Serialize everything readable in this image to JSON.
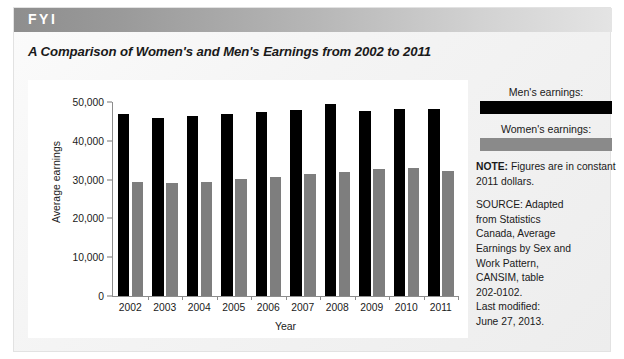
{
  "banner": {
    "label": "FYI"
  },
  "figure": {
    "title": "A Comparison of Women's and Men's Earnings from 2002 to 2011"
  },
  "legend": {
    "men_label": "Men's earnings:",
    "women_label": "Women's earnings:",
    "men_color": "#000000",
    "women_color": "#8a8a8a"
  },
  "note": {
    "label": "NOTE:",
    "text": "Figures are in constant 2011 dollars."
  },
  "source": {
    "lines": [
      "SOURCE: Adapted",
      "from Statistics",
      "Canada, Average",
      "Earnings by Sex and",
      "Work Pattern,",
      "CANSIM, table",
      "202-0102.",
      "Last modified:",
      "June 27, 2013."
    ]
  },
  "chart_data": {
    "type": "bar",
    "title": "A Comparison of Women's and Men's Earnings from 2002 to 2011",
    "xlabel": "Year",
    "ylabel": "Average earnings",
    "categories": [
      "2002",
      "2003",
      "2004",
      "2005",
      "2006",
      "2007",
      "2008",
      "2009",
      "2010",
      "2011"
    ],
    "series": [
      {
        "name": "Men's earnings:",
        "color": "#000000",
        "values": [
          46800,
          46000,
          46300,
          46800,
          47300,
          48000,
          49500,
          47700,
          48100,
          48300
        ]
      },
      {
        "name": "Women's earnings:",
        "color": "#7e7e7e",
        "values": [
          29300,
          29000,
          29400,
          30100,
          30800,
          31500,
          31900,
          32800,
          32900,
          32300
        ]
      }
    ],
    "ylim": [
      0,
      50000
    ],
    "yticks": [
      0,
      10000,
      20000,
      30000,
      40000,
      50000
    ],
    "ytick_labels": [
      "0",
      "10,000",
      "20,000",
      "30,000",
      "40,000",
      "50,000"
    ],
    "grid": false,
    "legend_position": "right"
  }
}
